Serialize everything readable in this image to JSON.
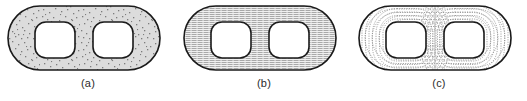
{
  "figure": {
    "background_color": "#ffffff",
    "outline_color": "#1a1a1a",
    "subfigures": [
      {
        "id": "a",
        "caption": "(a)",
        "fill_style": "stipple",
        "fill_description": "random dot stipple texture",
        "fill_color": "#d9d9d9",
        "pattern_ink_color": "#8a8a8a"
      },
      {
        "id": "b",
        "caption": "(b)",
        "fill_style": "horizontal-hatch",
        "fill_description": "horizontal line hatching",
        "fill_color": "#e2e2e2",
        "pattern_ink_color": "#9a9a9a"
      },
      {
        "id": "c",
        "caption": "(c)",
        "fill_style": "offset-contours",
        "fill_description": "concentric dotted offset contour lines meeting at the medial axis",
        "fill_color": "#ffffff",
        "pattern_ink_color": "#8f8f8f"
      }
    ]
  },
  "geometry": {
    "outer_shape": "stadium",
    "outer_x": 8,
    "outer_y": 6,
    "outer_width": 152,
    "outer_height": 64,
    "outer_corner_radius": 32,
    "holes": [
      {
        "x": 35,
        "y": 22,
        "width": 40,
        "height": 36,
        "corner_radius": 11
      },
      {
        "x": 93,
        "y": 22,
        "width": 40,
        "height": 36,
        "corner_radius": 11
      }
    ],
    "contour_offsets": [
      3,
      6.5,
      10,
      13.5,
      17,
      20.5,
      24
    ]
  }
}
